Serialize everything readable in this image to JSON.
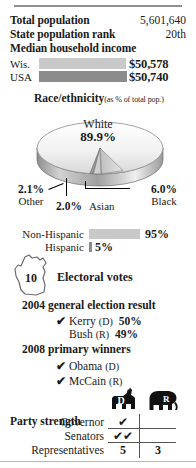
{
  "theme": {
    "bar_light": "#c9c9c9",
    "bar_dark": "#8c8c8c",
    "rule": "#8f8f8f",
    "text": "#1a1a1a"
  },
  "stats": {
    "total_population_label": "Total population",
    "total_population_value": "5,601,640",
    "rank_label": "State population rank",
    "rank_value": "20th",
    "median_income_label": "Median household income"
  },
  "income": {
    "rows": [
      {
        "name": "Wis.",
        "amount": "$50,578",
        "bar_pct": 99.6,
        "shade": "light"
      },
      {
        "name": "USA",
        "amount": "$50,740",
        "bar_pct": 100.0,
        "shade": "dark"
      }
    ]
  },
  "race": {
    "heading": "Race/ethnicity",
    "subheading": "(as % of total pop.)",
    "slices": [
      {
        "name": "White",
        "value": "89.9%",
        "pct": 89.9
      },
      {
        "name": "Black",
        "value": "6.0%",
        "pct": 6.0
      },
      {
        "name": "Asian",
        "value": "2.0%",
        "pct": 2.0
      },
      {
        "name": "Other",
        "value": "2.1%",
        "pct": 2.1
      }
    ]
  },
  "hispanic": {
    "rows": [
      {
        "name": "Non-Hispanic",
        "pct_label": "95%",
        "pct": 95
      },
      {
        "name": "Hispanic",
        "pct_label": "5%",
        "pct": 5
      }
    ]
  },
  "electoral": {
    "votes": "10",
    "label": "Electoral votes"
  },
  "election_2004": {
    "heading": "2004 general election result",
    "rows": [
      {
        "check": "✔",
        "winner": true,
        "candidate": "Kerry",
        "party": "(D)",
        "pct": "50%"
      },
      {
        "check": "",
        "winner": false,
        "candidate": "Bush",
        "party": "(R)",
        "pct": "49%"
      }
    ]
  },
  "primary_2008": {
    "heading": "2008 primary winners",
    "rows": [
      {
        "check": "✔",
        "candidate": "Obama",
        "party": "(D)"
      },
      {
        "check": "✔",
        "candidate": "McCain",
        "party": "(R)"
      }
    ]
  },
  "party_strength": {
    "heading": "Party strength",
    "columns": [
      {
        "letter": "D",
        "icon": "donkey-icon"
      },
      {
        "letter": "R",
        "icon": "elephant-icon"
      }
    ],
    "rows": [
      {
        "label": "Governor",
        "d": "✔",
        "r": ""
      },
      {
        "label": "Senators",
        "d": "✔✔",
        "r": ""
      },
      {
        "label": "Representatives",
        "d": "5",
        "r": "3"
      }
    ]
  }
}
